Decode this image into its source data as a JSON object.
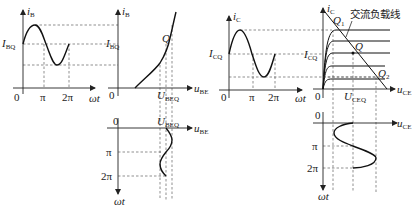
{
  "diagram": {
    "title": "",
    "panels": {
      "ib_time": {
        "y_axis": {
          "var": "i",
          "sub": "B"
        },
        "x_axis": {
          "var": "ωt"
        },
        "origin": "0",
        "ticks": [
          "π",
          "2π"
        ],
        "level_label": {
          "var": "I",
          "sub": "BQ"
        }
      },
      "input_characteristic": {
        "y_axis": {
          "var": "i",
          "sub": "B"
        },
        "x_axis": {
          "var": "u",
          "sub": "BE"
        },
        "origin": "0",
        "level_label": {
          "var": "I",
          "sub": "BQ"
        },
        "point": "Q",
        "x_label": {
          "var": "U",
          "sub": "BEQ"
        }
      },
      "ube_time": {
        "x_axis": {
          "var": "u",
          "sub": "BE"
        },
        "y_axis": {
          "var": "ωt"
        },
        "origin": "0",
        "ticks": [
          "π",
          "2π"
        ],
        "top_label": {
          "var": "U",
          "sub": "BEQ"
        }
      },
      "ic_time": {
        "y_axis": {
          "var": "i",
          "sub": "C"
        },
        "x_axis": {
          "var": "ωt"
        },
        "origin": "0",
        "ticks": [
          "π",
          "2π"
        ],
        "level_label": {
          "var": "I",
          "sub": "CQ"
        }
      },
      "output_characteristic": {
        "y_axis": {
          "var": "i",
          "sub": "C"
        },
        "x_axis": {
          "var": "u",
          "sub": "CE"
        },
        "origin": "0",
        "level_label": {
          "var": "I",
          "sub": "CQ"
        },
        "x_label": {
          "var": "U",
          "sub": "CEQ"
        },
        "points": {
          "q": "Q",
          "q1": "Q",
          "q1_sub": "1",
          "q2": "Q",
          "q2_sub": "2"
        },
        "load_line_label": "交流负载线"
      },
      "uce_time": {
        "x_axis": {
          "var": "u",
          "sub": "CE"
        },
        "y_axis": {
          "var": "ωt"
        },
        "origin": "0",
        "ticks": [
          "π",
          "2π"
        ]
      }
    },
    "colors": {
      "ink": "#111111",
      "dash": "#444444",
      "background": "#ffffff"
    }
  }
}
